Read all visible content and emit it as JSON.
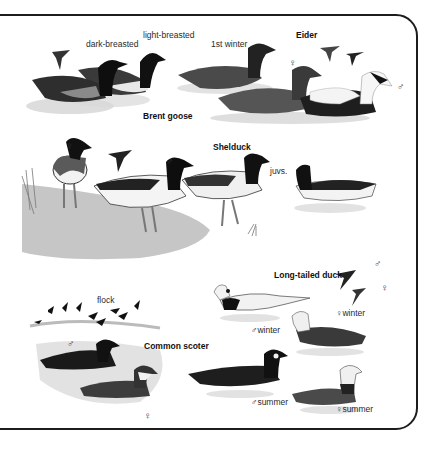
{
  "plate": {
    "species": [
      {
        "name": "Brent goose",
        "labels": {
          "dark": "dark-breasted",
          "light": "light-breasted"
        }
      },
      {
        "name": "Eider",
        "labels": {
          "first_winter": "1st winter",
          "female_symbol": "♀",
          "male_symbol": "♂"
        }
      },
      {
        "name": "Shelduck",
        "labels": {
          "juveniles": "juvs.",
          "female_symbol": "♀",
          "male_symbol": "♂"
        }
      },
      {
        "name": "Long-tailed duck",
        "labels": {
          "male_flight_symbol": "♂",
          "female_flight_symbol": "♀",
          "female_winter": "♀winter",
          "male_winter": "♂winter",
          "male_summer": "♂summer",
          "female_summer": "♀summer"
        }
      },
      {
        "name": "Common scoter",
        "labels": {
          "flock": "flock",
          "male_symbol": "♂",
          "female_symbol": "♀"
        }
      }
    ]
  },
  "colors": {
    "ink": "#1a1a1a",
    "border": "#1c1c1c",
    "water": "#bdbdbd",
    "shore": "#c8c8c8",
    "paper": "#ffffff"
  }
}
